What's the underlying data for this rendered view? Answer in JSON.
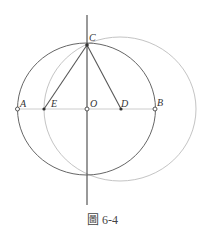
{
  "figure": {
    "caption": "圖 6-4",
    "points": [
      {
        "name": "A",
        "x": 17.5,
        "y": 109
      },
      {
        "name": "E",
        "x": 44,
        "y": 109
      },
      {
        "name": "O",
        "x": 87,
        "y": 109
      },
      {
        "name": "D",
        "x": 121,
        "y": 109
      },
      {
        "name": "B",
        "x": 155,
        "y": 109
      },
      {
        "name": "C",
        "x": 87,
        "y": 45
      }
    ],
    "colors": {
      "dark": "#555555",
      "light": "#bbbbbb"
    }
  }
}
